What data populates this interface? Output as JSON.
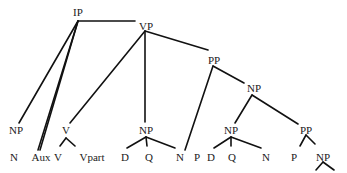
{
  "diagram": {
    "type": "syntax-tree",
    "nodes": {
      "ip": {
        "label": "IP",
        "x": 78,
        "y": 12
      },
      "vp": {
        "label": "VP",
        "x": 146,
        "y": 26
      },
      "pp_top": {
        "label": "PP",
        "x": 214,
        "y": 60
      },
      "np_mid": {
        "label": "NP",
        "x": 254,
        "y": 88
      },
      "np_subj": {
        "label": "NP",
        "x": 16,
        "y": 130
      },
      "v_cmp": {
        "label": "V",
        "x": 66,
        "y": 130
      },
      "np_obj": {
        "label": "NP",
        "x": 146,
        "y": 130
      },
      "np_inner": {
        "label": "NP",
        "x": 231,
        "y": 130
      },
      "pp_inner": {
        "label": "PP",
        "x": 306,
        "y": 130
      },
      "n1": {
        "label": "N",
        "x": 14,
        "y": 157
      },
      "aux": {
        "label": "Aux",
        "x": 41,
        "y": 157
      },
      "v": {
        "label": "V",
        "x": 58,
        "y": 157
      },
      "vpart": {
        "label": "Vpart",
        "x": 92,
        "y": 157
      },
      "d1": {
        "label": "D",
        "x": 125,
        "y": 157
      },
      "q1": {
        "label": "Q",
        "x": 149,
        "y": 157
      },
      "n2": {
        "label": "N",
        "x": 180,
        "y": 157
      },
      "p1": {
        "label": "P",
        "x": 197,
        "y": 157
      },
      "d2": {
        "label": "D",
        "x": 211,
        "y": 157
      },
      "q2": {
        "label": "Q",
        "x": 232,
        "y": 157
      },
      "n3": {
        "label": "N",
        "x": 266,
        "y": 157
      },
      "p2": {
        "label": "P",
        "x": 294,
        "y": 157
      },
      "np_last": {
        "label": "NP",
        "x": 323,
        "y": 157
      }
    },
    "edges": [
      [
        78,
        21,
        135,
        21
      ],
      [
        78,
        21,
        19,
        123
      ],
      [
        78,
        21,
        40,
        150
      ],
      [
        78,
        21,
        38,
        150
      ],
      [
        145,
        31,
        70,
        123
      ],
      [
        145,
        31,
        145,
        122
      ],
      [
        145,
        31,
        208,
        50
      ],
      [
        213,
        66,
        185,
        150
      ],
      [
        213,
        66,
        244,
        83
      ],
      [
        252,
        95,
        235,
        123
      ],
      [
        252,
        95,
        298,
        124
      ],
      [
        66,
        138,
        60,
        146
      ],
      [
        66,
        138,
        75,
        146
      ],
      [
        146,
        137,
        127,
        148
      ],
      [
        146,
        137,
        147,
        146
      ],
      [
        146,
        137,
        175,
        148
      ],
      [
        231,
        137,
        214,
        148
      ],
      [
        231,
        137,
        231,
        146
      ],
      [
        231,
        137,
        261,
        148
      ],
      [
        306,
        135,
        300,
        146
      ],
      [
        306,
        135,
        315,
        144
      ],
      [
        323,
        162,
        316,
        170
      ],
      [
        323,
        162,
        334,
        170
      ]
    ]
  }
}
